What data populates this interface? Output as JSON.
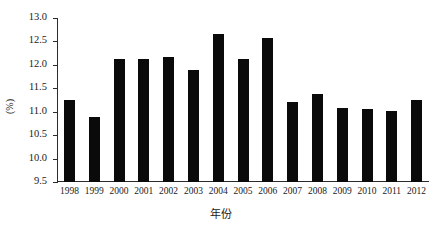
{
  "chart_data": {
    "type": "bar",
    "title": "",
    "xlabel": "年份",
    "ylabel": "(%)",
    "ylim": [
      9.5,
      13.0
    ],
    "ytick_step": 0.5,
    "grid": false,
    "legend": "none",
    "bar_color": "#0a0a0a",
    "axis_color": "#2b2b2b",
    "categories": [
      "1998",
      "1999",
      "2000",
      "2001",
      "2002",
      "2003",
      "2004",
      "2005",
      "2006",
      "2007",
      "2008",
      "2009",
      "2010",
      "2011",
      "2012"
    ],
    "values": [
      11.26,
      10.88,
      12.13,
      12.12,
      12.17,
      11.9,
      12.65,
      12.12,
      12.58,
      11.2,
      11.38,
      11.08,
      11.05,
      11.01,
      11.25
    ],
    "ytick_labels": [
      "13.0",
      "12.5",
      "12.0",
      "11.5",
      "11.0",
      "10.5",
      "10.0",
      "9.5"
    ],
    "ytick_values": [
      13.0,
      12.5,
      12.0,
      11.5,
      11.0,
      10.5,
      10.0,
      9.5
    ]
  }
}
